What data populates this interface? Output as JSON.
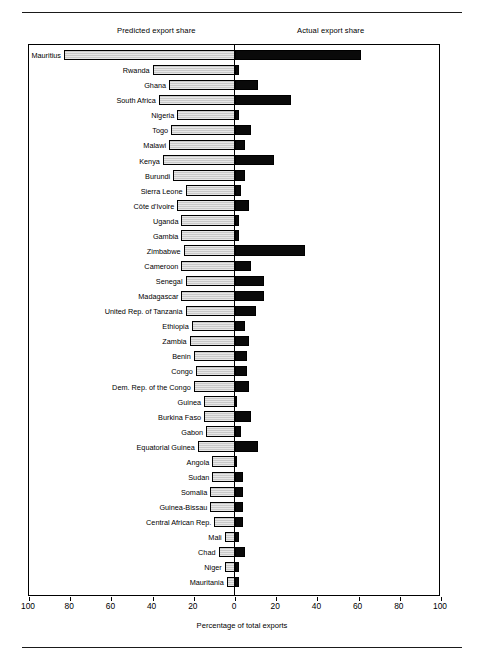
{
  "figure": {
    "column_titles": {
      "left": "Predicted export share",
      "right": "Actual export share"
    },
    "xlabel": "Percentage of total exports",
    "tick_labels": [
      "100",
      "80",
      "60",
      "40",
      "20",
      "0",
      "20",
      "40",
      "60",
      "80",
      "100"
    ],
    "colors": {
      "predicted_fill": "#c9c9c9",
      "actual_fill": "#0a0a0a",
      "frame": "#000000",
      "background": "#ffffff"
    }
  },
  "chart_data": {
    "type": "bar",
    "title": "",
    "subtitle": "",
    "orientation": "horizontal",
    "layout": "mirrored-population-pyramid",
    "xlabel": "Percentage of total exports",
    "ylabel": "",
    "grid": false,
    "legend_position": "top",
    "axis": {
      "left_range": [
        100,
        0
      ],
      "right_range": [
        0,
        100
      ],
      "tick_step": 20,
      "center_value": 0
    },
    "categories": [
      "Mauritius",
      "Rwanda",
      "Ghana",
      "South Africa",
      "Nigeria",
      "Togo",
      "Malawi",
      "Kenya",
      "Burundi",
      "Sierra Leone",
      "Côte d'Ivoire",
      "Uganda",
      "Gambia",
      "Zimbabwe",
      "Cameroon",
      "Senegal",
      "Madagascar",
      "United Rep. of Tanzania",
      "Ethiopia",
      "Zambia",
      "Benin",
      "Congo",
      "Dem. Rep. of the Congo",
      "Guinea",
      "Burkina Faso",
      "Gabon",
      "Equatorial Guinea",
      "Angola",
      "Sudan",
      "Somalia",
      "Guinea-Bissau",
      "Central African Rep.",
      "Mali",
      "Chad",
      "Niger",
      "Mauritania"
    ],
    "series": [
      {
        "name": "Predicted export share",
        "side": "left",
        "values": [
          83,
          40,
          32,
          37,
          28,
          31,
          32,
          35,
          30,
          24,
          28,
          26,
          26,
          25,
          26,
          24,
          26,
          24,
          21,
          22,
          20,
          19,
          20,
          15,
          15,
          14,
          18,
          11,
          11,
          12,
          12,
          10,
          5,
          8,
          5,
          4
        ]
      },
      {
        "name": "Actual export share",
        "side": "right",
        "values": [
          61,
          2,
          11,
          27,
          2,
          8,
          5,
          19,
          5,
          3,
          7,
          2,
          2,
          34,
          8,
          14,
          14,
          10,
          5,
          7,
          6,
          6,
          7,
          1,
          8,
          3,
          11,
          1,
          4,
          4,
          4,
          4,
          2,
          5,
          2,
          2
        ]
      }
    ]
  }
}
